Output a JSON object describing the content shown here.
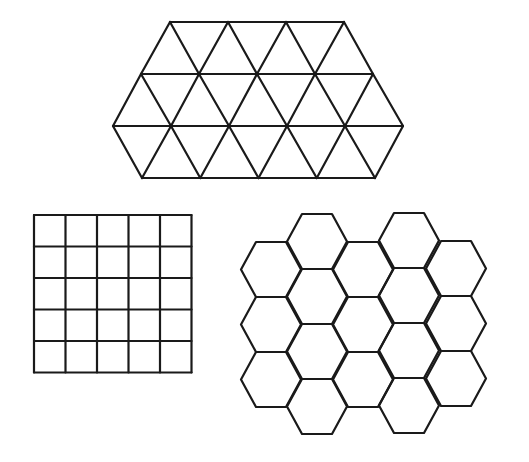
{
  "diagram": {
    "description": "Three regular tilings of the plane",
    "stroke_color": "#1a1a1a",
    "background": "#ffffff",
    "tilings": [
      {
        "name": "triangle-tiling",
        "shape": "equilateral triangle",
        "rows": [
          {
            "y": 22,
            "x_start": 170,
            "x_end": 344
          },
          {
            "y": 74,
            "x_start": 141,
            "x_end": 373
          },
          {
            "y": 126,
            "x_start": 113,
            "x_end": 403
          },
          {
            "y": 178,
            "x_start": 142,
            "x_end": 375
          }
        ],
        "spacing": 58
      },
      {
        "name": "square-tiling",
        "shape": "square",
        "x": 34,
        "y": 215,
        "cols": 5,
        "rows": 5,
        "cell": 31.5
      },
      {
        "name": "hexagon-tiling",
        "shape": "regular hexagon (flat-top)",
        "columns": [
          {
            "cx": 271,
            "top": 242,
            "count": 3
          },
          {
            "cx": 317,
            "top": 214,
            "count": 4
          },
          {
            "cx": 363,
            "top": 242,
            "count": 3
          },
          {
            "cx": 409,
            "top": 213,
            "count": 4
          },
          {
            "cx": 456,
            "top": 241,
            "count": 3
          }
        ],
        "half_width": 30,
        "half_side": 15,
        "height": 55
      }
    ]
  }
}
